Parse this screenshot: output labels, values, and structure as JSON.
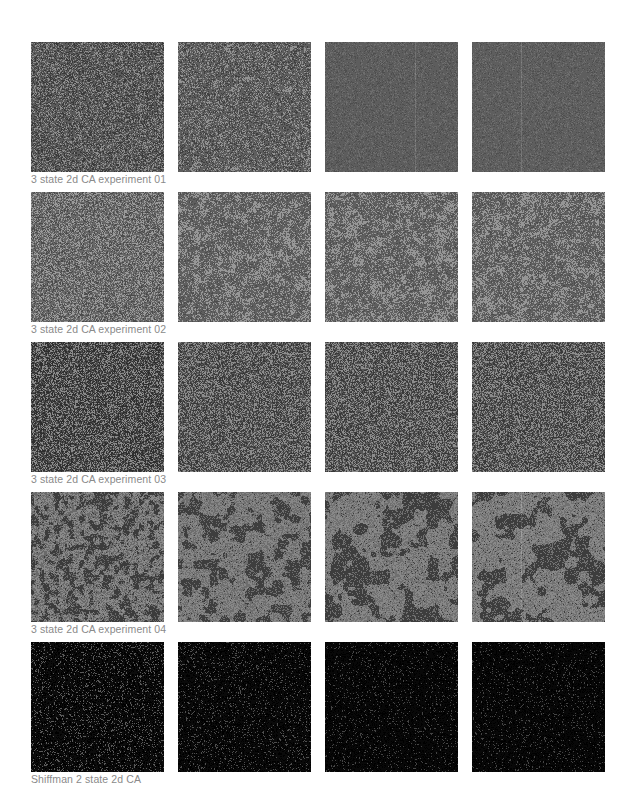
{
  "gallery": {
    "rows": [
      {
        "caption": "3 state 2d CA experiment 01",
        "style": "fine-noise",
        "tiles": [
          {
            "label": "experiment 01 frame 1",
            "base": "#5a5a5a",
            "light": "#8e8e8e",
            "dark": "#3a3a3a",
            "lightRatio": 0.22,
            "darkRatio": 0.25,
            "blob": 0,
            "stripes": 0
          },
          {
            "label": "experiment 01 frame 2",
            "base": "#5e5e5e",
            "light": "#939393",
            "dark": "#404040",
            "lightRatio": 0.2,
            "darkRatio": 0.2,
            "blob": 0.3,
            "stripes": 0
          },
          {
            "label": "experiment 01 frame 3",
            "base": "#5d5d5d",
            "light": "#6e6e6e",
            "dark": "#4e4e4e",
            "lightRatio": 0.15,
            "darkRatio": 0.15,
            "blob": 0,
            "stripes": 1
          },
          {
            "label": "experiment 01 frame 4",
            "base": "#5e5e5e",
            "light": "#6f6f6f",
            "dark": "#4f4f4f",
            "lightRatio": 0.15,
            "darkRatio": 0.15,
            "blob": 0,
            "stripes": 1
          }
        ]
      },
      {
        "caption": "3 state 2d CA experiment 02",
        "style": "speckle",
        "tiles": [
          {
            "label": "experiment 02 frame 1",
            "base": "#676767",
            "light": "#9a9a9a",
            "dark": "#4a4a4a",
            "lightRatio": 0.3,
            "darkRatio": 0.2,
            "blob": 0.2,
            "stripes": 0
          },
          {
            "label": "experiment 02 frame 2",
            "base": "#5f5f5f",
            "light": "#979797",
            "dark": "#4c4c4c",
            "lightRatio": 0.22,
            "darkRatio": 0.15,
            "blob": 0.5,
            "stripes": 0
          },
          {
            "label": "experiment 02 frame 3",
            "base": "#5f5f5f",
            "light": "#969696",
            "dark": "#4c4c4c",
            "lightRatio": 0.22,
            "darkRatio": 0.15,
            "blob": 0.5,
            "stripes": 0
          },
          {
            "label": "experiment 02 frame 4",
            "base": "#5f5f5f",
            "light": "#969696",
            "dark": "#4c4c4c",
            "lightRatio": 0.24,
            "darkRatio": 0.15,
            "blob": 0.5,
            "stripes": 0
          }
        ]
      },
      {
        "caption": "3 state 2d CA experiment 03",
        "style": "salt-pepper",
        "tiles": [
          {
            "label": "experiment 03 frame 1",
            "base": "#4c4c4c",
            "light": "#8a8a8a",
            "dark": "#2e2e2e",
            "lightRatio": 0.3,
            "darkRatio": 0.35,
            "blob": 0,
            "stripes": 0
          },
          {
            "label": "experiment 03 frame 2",
            "base": "#555555",
            "light": "#8c8c8c",
            "dark": "#383838",
            "lightRatio": 0.33,
            "darkRatio": 0.3,
            "blob": 0,
            "stripes": 0
          },
          {
            "label": "experiment 03 frame 3",
            "base": "#555555",
            "light": "#8c8c8c",
            "dark": "#383838",
            "lightRatio": 0.33,
            "darkRatio": 0.3,
            "blob": 0,
            "stripes": 0
          },
          {
            "label": "experiment 03 frame 4",
            "base": "#555555",
            "light": "#8c8c8c",
            "dark": "#383838",
            "lightRatio": 0.33,
            "darkRatio": 0.3,
            "blob": 0,
            "stripes": 0
          }
        ]
      },
      {
        "caption": "3 state 2d CA experiment 04",
        "style": "blobs",
        "tiles": [
          {
            "label": "experiment 04 frame 1",
            "base": "#6a6a6a",
            "light": "#8a8a8a",
            "dark": "#3c3c3c",
            "lightRatio": 0.25,
            "darkRatio": 0.25,
            "blob": 0.45,
            "stripes": 0,
            "scale": 5
          },
          {
            "label": "experiment 04 frame 2",
            "base": "#6e6e6e",
            "light": "#878787",
            "dark": "#3e3e3e",
            "lightRatio": 0.2,
            "darkRatio": 0.1,
            "blob": 0.42,
            "stripes": 0,
            "scale": 9
          },
          {
            "label": "experiment 04 frame 3",
            "base": "#707070",
            "light": "#888888",
            "dark": "#3d3d3d",
            "lightRatio": 0.2,
            "darkRatio": 0.1,
            "blob": 0.45,
            "stripes": 0,
            "scale": 12
          },
          {
            "label": "experiment 04 frame 4",
            "base": "#717171",
            "light": "#898989",
            "dark": "#3d3d3d",
            "lightRatio": 0.2,
            "darkRatio": 0.1,
            "blob": 0.47,
            "stripes": 1,
            "scale": 14
          }
        ]
      },
      {
        "caption": "Shiffman 2 state 2d CA",
        "style": "sparse",
        "tiles": [
          {
            "label": "Shiffman CA frame 1",
            "base": "#0c0c0c",
            "light": "#5a5a5a",
            "dark": "#000000",
            "lightRatio": 0.12,
            "darkRatio": 0.3,
            "blob": 0,
            "stripes": 0
          },
          {
            "label": "Shiffman CA frame 2",
            "base": "#0a0a0a",
            "light": "#4e4e4e",
            "dark": "#000000",
            "lightRatio": 0.09,
            "darkRatio": 0.3,
            "blob": 0,
            "stripes": 0
          },
          {
            "label": "Shiffman CA frame 3",
            "base": "#080808",
            "light": "#444444",
            "dark": "#000000",
            "lightRatio": 0.07,
            "darkRatio": 0.3,
            "blob": 0,
            "stripes": 0
          },
          {
            "label": "Shiffman CA frame 4",
            "base": "#080808",
            "light": "#444444",
            "dark": "#000000",
            "lightRatio": 0.07,
            "darkRatio": 0.3,
            "blob": 0,
            "stripes": 0
          }
        ]
      }
    ]
  },
  "layout": {
    "row_tops": [
      42,
      192,
      342,
      492,
      642
    ],
    "tile_lefts": [
      0,
      147,
      294,
      441
    ]
  }
}
